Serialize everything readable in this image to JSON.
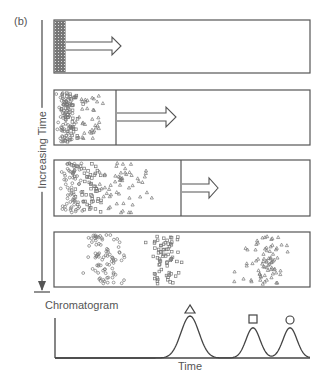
{
  "figure": {
    "panel_label": "(b)",
    "time_axis_label": "Increasing Time",
    "colors": {
      "stroke": "#555555",
      "band": "#666666",
      "background": "#ffffff"
    },
    "columns": [
      {
        "stage": 1,
        "description": "Sample mixture loaded as narrow band at column inlet",
        "divider_x": 66,
        "arrow": "flow-arrow"
      },
      {
        "stage": 2,
        "description": "Mixture begins to spread; triangles move ahead",
        "divider_x": 116,
        "arrow": "flow-arrow"
      },
      {
        "stage": 3,
        "description": "Further separation; triangles lead, squares and circles behind",
        "divider_x": 181,
        "arrow": "flow-arrow"
      },
      {
        "stage": 4,
        "description": "Bands separated: circles (left), squares (middle), triangles (right)"
      }
    ],
    "species": [
      {
        "name": "triangle",
        "symbol": "△"
      },
      {
        "name": "square",
        "symbol": "□"
      },
      {
        "name": "circle",
        "symbol": "○"
      }
    ]
  },
  "chromatogram": {
    "title": "Chromatogram",
    "xlabel": "Time",
    "peaks": [
      {
        "species": "triangle",
        "symbol": "△",
        "position": 190,
        "relative_height": 1.0
      },
      {
        "species": "square",
        "symbol": "□",
        "position": 253,
        "relative_height": 0.72
      },
      {
        "species": "circle",
        "symbol": "○",
        "position": 290,
        "relative_height": 0.72
      }
    ]
  }
}
